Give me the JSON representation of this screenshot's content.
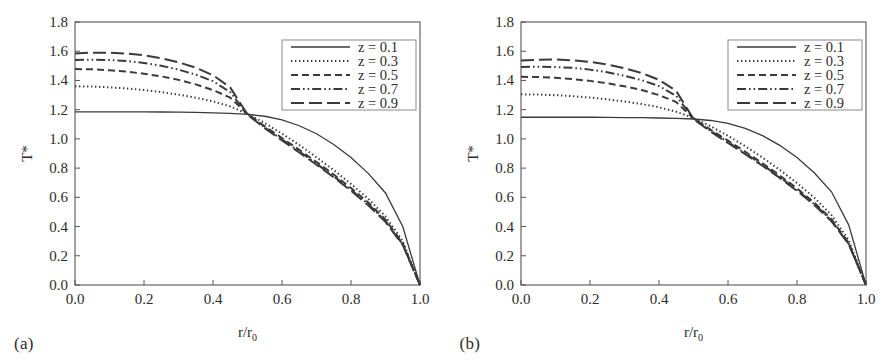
{
  "figure": {
    "panels": [
      {
        "id": "panel-a",
        "label": "(a)",
        "legend_title": "",
        "chart_data": {
          "type": "line",
          "title": "",
          "xlabel": "r/r0",
          "xlabel_main": "r/r",
          "xlabel_sub": "0",
          "ylabel": "T*",
          "xlim": [
            0.0,
            1.0
          ],
          "ylim": [
            0.0,
            1.8
          ],
          "xticks": [
            "0.0",
            "0.2",
            "0.4",
            "0.6",
            "0.8",
            "1.0"
          ],
          "yticks": [
            "0.0",
            "0.2",
            "0.4",
            "0.6",
            "0.8",
            "1.0",
            "1.2",
            "1.4",
            "1.6",
            "1.8"
          ],
          "grid": false,
          "legend_position": "upper right",
          "x": [
            0.0,
            0.05,
            0.1,
            0.15,
            0.2,
            0.25,
            0.3,
            0.35,
            0.4,
            0.45,
            0.5,
            0.55,
            0.6,
            0.65,
            0.7,
            0.75,
            0.8,
            0.85,
            0.9,
            0.95,
            1.0
          ],
          "series": [
            {
              "name": "z = 0.1",
              "style": "solid",
              "values": [
                1.185,
                1.185,
                1.185,
                1.185,
                1.185,
                1.184,
                1.183,
                1.181,
                1.178,
                1.174,
                1.168,
                1.155,
                1.13,
                1.09,
                1.035,
                0.962,
                0.872,
                0.764,
                0.63,
                0.4,
                0.0
              ]
            },
            {
              "name": "z = 0.3",
              "style": "dotted",
              "values": [
                1.36,
                1.358,
                1.353,
                1.345,
                1.334,
                1.32,
                1.303,
                1.282,
                1.257,
                1.222,
                1.172,
                1.108,
                1.036,
                0.958,
                0.874,
                0.786,
                0.692,
                0.59,
                0.47,
                0.3,
                0.0
              ]
            },
            {
              "name": "z = 0.5",
              "style": "dashed",
              "values": [
                1.478,
                1.476,
                1.47,
                1.46,
                1.446,
                1.428,
                1.404,
                1.373,
                1.334,
                1.282,
                1.17,
                1.086,
                1.006,
                0.925,
                0.842,
                0.756,
                0.664,
                0.564,
                0.448,
                0.285,
                0.0
              ]
            },
            {
              "name": "z = 0.7",
              "style": "dashdotdot",
              "values": [
                1.54,
                1.542,
                1.54,
                1.533,
                1.52,
                1.5,
                1.474,
                1.44,
                1.395,
                1.32,
                1.168,
                1.078,
                0.996,
                0.914,
                0.83,
                0.744,
                0.652,
                0.553,
                0.438,
                0.278,
                0.0
              ]
            },
            {
              "name": "z = 0.9",
              "style": "longdash",
              "values": [
                1.585,
                1.59,
                1.59,
                1.584,
                1.572,
                1.552,
                1.524,
                1.487,
                1.436,
                1.352,
                1.166,
                1.073,
                0.99,
                0.907,
                0.823,
                0.737,
                0.645,
                0.546,
                0.432,
                0.274,
                0.0
              ]
            }
          ]
        }
      },
      {
        "id": "panel-b",
        "label": "(b)",
        "legend_title": "",
        "chart_data": {
          "type": "line",
          "title": "",
          "xlabel": "r/r0",
          "xlabel_main": "r/r",
          "xlabel_sub": "0",
          "ylabel": "T*",
          "xlim": [
            0.0,
            1.0
          ],
          "ylim": [
            0.0,
            1.8
          ],
          "xticks": [
            "0.0",
            "0.2",
            "0.4",
            "0.6",
            "0.8",
            "1.0"
          ],
          "yticks": [
            "0.0",
            "0.2",
            "0.4",
            "0.6",
            "0.8",
            "1.0",
            "1.2",
            "1.4",
            "1.6",
            "1.8"
          ],
          "grid": false,
          "legend_position": "upper right",
          "x": [
            0.0,
            0.05,
            0.1,
            0.15,
            0.2,
            0.25,
            0.3,
            0.35,
            0.4,
            0.45,
            0.5,
            0.55,
            0.6,
            0.65,
            0.7,
            0.75,
            0.8,
            0.85,
            0.9,
            0.95,
            1.0
          ],
          "series": [
            {
              "name": "z = 0.1",
              "style": "solid",
              "values": [
                1.148,
                1.148,
                1.148,
                1.148,
                1.148,
                1.147,
                1.146,
                1.145,
                1.143,
                1.14,
                1.136,
                1.126,
                1.106,
                1.072,
                1.022,
                0.956,
                0.872,
                0.768,
                0.638,
                0.41,
                0.0
              ]
            },
            {
              "name": "z = 0.3",
              "style": "dotted",
              "values": [
                1.305,
                1.303,
                1.299,
                1.292,
                1.283,
                1.271,
                1.256,
                1.238,
                1.216,
                1.186,
                1.142,
                1.086,
                1.021,
                0.95,
                0.872,
                0.788,
                0.698,
                0.598,
                0.478,
                0.306,
                0.0
              ]
            },
            {
              "name": "z = 0.5",
              "style": "dashed",
              "values": [
                1.425,
                1.423,
                1.418,
                1.409,
                1.397,
                1.381,
                1.36,
                1.334,
                1.3,
                1.252,
                1.14,
                1.062,
                0.988,
                0.912,
                0.833,
                0.75,
                0.661,
                0.564,
                0.45,
                0.288,
                0.0
              ]
            },
            {
              "name": "z = 0.7",
              "style": "dashdotdot",
              "values": [
                1.492,
                1.494,
                1.492,
                1.486,
                1.474,
                1.456,
                1.432,
                1.402,
                1.361,
                1.294,
                1.138,
                1.054,
                0.978,
                0.901,
                0.822,
                0.739,
                0.65,
                0.554,
                0.441,
                0.282,
                0.0
              ]
            },
            {
              "name": "z = 0.9",
              "style": "longdash",
              "values": [
                1.536,
                1.542,
                1.543,
                1.538,
                1.527,
                1.509,
                1.483,
                1.45,
                1.404,
                1.328,
                1.136,
                1.049,
                0.972,
                0.895,
                0.816,
                0.733,
                0.644,
                0.548,
                0.436,
                0.279,
                0.0
              ]
            }
          ]
        }
      }
    ],
    "colors": {
      "line": "#3a3a3a",
      "axis": "#555555",
      "text": "#2b2b2b",
      "background": "#ffffff",
      "legend_border": "#8a8a8a"
    }
  }
}
